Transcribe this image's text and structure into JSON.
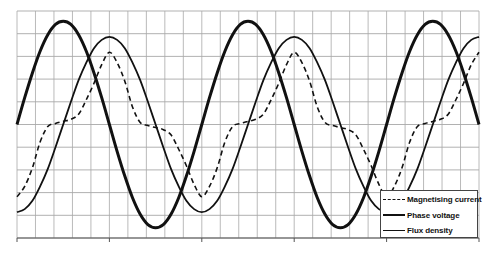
{
  "chart_data": {
    "type": "line",
    "title": "",
    "xlabel": "",
    "ylabel": "",
    "x_unit": "electrical degrees (not labeled)",
    "x": [
      0,
      15,
      30,
      45,
      60,
      75,
      90,
      105,
      120,
      135,
      150,
      165,
      180,
      195,
      210,
      225,
      240,
      255,
      270,
      285,
      300,
      315,
      330,
      345,
      360,
      375,
      390,
      405,
      420,
      435,
      450,
      465,
      480,
      495,
      510,
      525,
      540,
      555,
      570,
      585,
      600,
      615,
      630,
      645,
      660,
      675,
      690,
      705,
      720,
      735,
      750,
      765,
      780,
      795,
      810,
      825,
      840,
      855,
      870,
      885,
      900
    ],
    "xlim": [
      0,
      900
    ],
    "ylim": [
      -1.1,
      1.1
    ],
    "grid": true,
    "grid_x_divisions": 25,
    "grid_y_divisions": 10,
    "major_x_ticks_every": 5,
    "tick_labels_visible": false,
    "legend_position": "lower right",
    "series": [
      {
        "name": "Magnetising current",
        "style": "dashed",
        "values": [
          -0.7,
          -0.6,
          -0.42,
          -0.17,
          -0.02,
          0.01,
          0.03,
          0.05,
          0.1,
          0.24,
          0.4,
          0.58,
          0.7,
          0.6,
          0.42,
          0.17,
          0.02,
          -0.01,
          -0.03,
          -0.05,
          -0.1,
          -0.24,
          -0.4,
          -0.58,
          -0.7,
          -0.6,
          -0.42,
          -0.17,
          -0.02,
          0.01,
          0.03,
          0.05,
          0.1,
          0.24,
          0.4,
          0.58,
          0.7,
          0.6,
          0.42,
          0.17,
          0.02,
          -0.01,
          -0.03,
          -0.05,
          -0.1,
          -0.24,
          -0.4,
          -0.58,
          -0.7,
          -0.6,
          -0.42,
          -0.17,
          -0.02,
          0.01,
          0.03,
          0.05,
          0.1,
          0.24,
          0.4,
          0.58,
          0.7
        ]
      },
      {
        "name": "Phase voltage",
        "style": "thick",
        "values": [
          0,
          0.26,
          0.5,
          0.71,
          0.87,
          0.97,
          1,
          0.97,
          0.87,
          0.71,
          0.5,
          0.26,
          0,
          -0.26,
          -0.5,
          -0.71,
          -0.87,
          -0.97,
          -1,
          -0.97,
          -0.87,
          -0.71,
          -0.5,
          -0.26,
          0,
          0.26,
          0.5,
          0.71,
          0.87,
          0.97,
          1,
          0.97,
          0.87,
          0.71,
          0.5,
          0.26,
          0,
          -0.26,
          -0.5,
          -0.71,
          -0.87,
          -0.97,
          -1,
          -0.97,
          -0.87,
          -0.71,
          -0.5,
          -0.26,
          0,
          0.26,
          0.5,
          0.71,
          0.87,
          0.97,
          1,
          0.97,
          0.87,
          0.71,
          0.5,
          0.26,
          0
        ]
      },
      {
        "name": "Flux density",
        "style": "solid",
        "values": [
          -0.85,
          -0.82,
          -0.74,
          -0.6,
          -0.43,
          -0.22,
          0,
          0.22,
          0.43,
          0.6,
          0.74,
          0.82,
          0.85,
          0.82,
          0.74,
          0.6,
          0.43,
          0.22,
          0,
          -0.22,
          -0.43,
          -0.6,
          -0.74,
          -0.82,
          -0.85,
          -0.82,
          -0.74,
          -0.6,
          -0.43,
          -0.22,
          0,
          0.22,
          0.43,
          0.6,
          0.74,
          0.82,
          0.85,
          0.82,
          0.74,
          0.6,
          0.43,
          0.22,
          0,
          -0.22,
          -0.43,
          -0.6,
          -0.74,
          -0.82,
          -0.85,
          -0.82,
          -0.74,
          -0.6,
          -0.43,
          -0.22,
          0,
          0.22,
          0.43,
          0.6,
          0.74,
          0.82,
          0.85
        ]
      }
    ]
  },
  "legend": {
    "items": [
      {
        "label": "Magnetising current",
        "style": "dashed"
      },
      {
        "label": "Phase voltage",
        "style": "thick"
      },
      {
        "label": "Flux density",
        "style": "solid"
      }
    ]
  },
  "colors": {
    "grid": "#a8a8a8",
    "axis": "#555555",
    "line": "#111111",
    "background": "#ffffff"
  }
}
